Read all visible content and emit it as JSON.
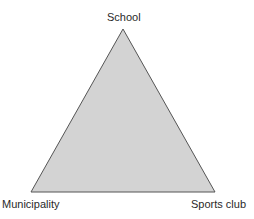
{
  "diagram": {
    "type": "triangle",
    "vertices": {
      "top": {
        "label": "School"
      },
      "bottom_left": {
        "label": "Municipality"
      },
      "bottom_right": {
        "label": "Sports club"
      }
    },
    "colors": {
      "fill": "#d3d3d3",
      "stroke": "#555555"
    }
  }
}
